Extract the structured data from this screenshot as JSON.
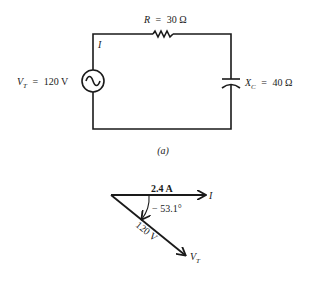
{
  "circuit": {
    "resistor": {
      "symbol": "R",
      "eq": "=",
      "value": "30 Ω"
    },
    "current": {
      "symbol": "I"
    },
    "source": {
      "symbol": "V",
      "subscript": "T",
      "eq": "=",
      "value": "120 V"
    },
    "capacitor": {
      "symbol": "X",
      "subscript": "C",
      "eq": "=",
      "value": "40 Ω"
    },
    "caption": "(a)"
  },
  "phasor": {
    "current_magnitude": "2.4 A",
    "current_label": "I",
    "angle": "− 53.1°",
    "voltage_magnitude": "120 V",
    "voltage_label": "V",
    "voltage_subscript": "T"
  },
  "colors": {
    "ink": "#1a1a1a",
    "background": "#ffffff"
  }
}
